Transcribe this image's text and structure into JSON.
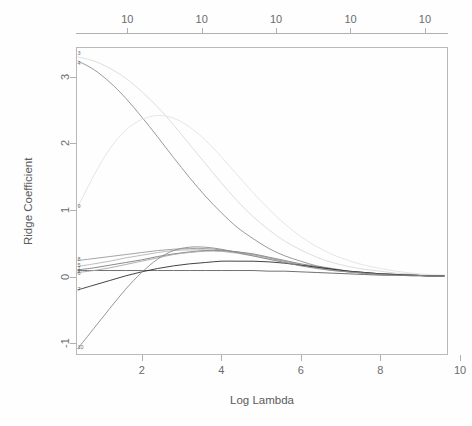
{
  "chart_data": {
    "type": "line",
    "title": "",
    "subtitle": "",
    "xlabel": "Log Lambda",
    "ylabel": "Ridge Coefficient",
    "xlim": [
      0.35,
      9.7
    ],
    "ylim": [
      -1.18,
      3.45
    ],
    "xticks": [
      "2",
      "4",
      "6",
      "8",
      "10"
    ],
    "xtick_values": [
      2,
      4,
      6,
      8,
      10
    ],
    "yticks": [
      "3",
      "2",
      "1",
      "0",
      "-1"
    ],
    "ytick_values": [
      3,
      2,
      1,
      0,
      -1
    ],
    "top_axis_label": "",
    "top_ticks": [
      "10",
      "10",
      "10",
      "10",
      "10"
    ],
    "top_tick_values": [
      10,
      10,
      10,
      10,
      10
    ],
    "grid": false,
    "legend_position": "left-edge-labels",
    "x": [
      0.4,
      0.8,
      1.2,
      1.6,
      2.0,
      2.4,
      2.8,
      3.2,
      3.6,
      4.0,
      4.4,
      4.8,
      5.2,
      5.6,
      6.0,
      6.4,
      6.8,
      7.2,
      7.6,
      8.0,
      8.4,
      8.8,
      9.2,
      9.6
    ],
    "series": [
      {
        "name": "3",
        "label": "3",
        "color": "#d9d9d9",
        "values": [
          3.3,
          3.24,
          3.13,
          2.98,
          2.78,
          2.55,
          2.28,
          1.99,
          1.7,
          1.41,
          1.14,
          0.9,
          0.7,
          0.53,
          0.4,
          0.29,
          0.21,
          0.15,
          0.11,
          0.08,
          0.05,
          0.04,
          0.02,
          0.01
        ]
      },
      {
        "name": "4",
        "label": "4",
        "color": "#8f8f8f",
        "values": [
          3.24,
          3.11,
          2.92,
          2.68,
          2.4,
          2.1,
          1.79,
          1.49,
          1.21,
          0.96,
          0.74,
          0.57,
          0.42,
          0.31,
          0.23,
          0.16,
          0.12,
          0.08,
          0.06,
          0.04,
          0.03,
          0.02,
          0.01,
          0.01
        ]
      },
      {
        "name": "9",
        "label": "9",
        "color": "#e2e2e2",
        "values": [
          1.05,
          1.52,
          1.92,
          2.2,
          2.36,
          2.42,
          2.38,
          2.25,
          2.05,
          1.8,
          1.53,
          1.26,
          1.01,
          0.79,
          0.6,
          0.45,
          0.33,
          0.24,
          0.17,
          0.12,
          0.08,
          0.05,
          0.03,
          0.02
        ]
      },
      {
        "name": "8",
        "label": "8",
        "color": "#9a9a9a",
        "values": [
          0.24,
          0.27,
          0.3,
          0.33,
          0.36,
          0.39,
          0.41,
          0.42,
          0.42,
          0.4,
          0.37,
          0.33,
          0.28,
          0.23,
          0.18,
          0.14,
          0.1,
          0.07,
          0.05,
          0.04,
          0.03,
          0.02,
          0.01,
          0.01
        ]
      },
      {
        "name": "5",
        "label": "5",
        "color": "#b5b5b5",
        "values": [
          0.15,
          0.19,
          0.23,
          0.28,
          0.32,
          0.36,
          0.39,
          0.4,
          0.4,
          0.38,
          0.35,
          0.31,
          0.26,
          0.21,
          0.17,
          0.13,
          0.09,
          0.07,
          0.05,
          0.03,
          0.02,
          0.02,
          0.01,
          0.01
        ]
      },
      {
        "name": "1",
        "label": "1",
        "color": "#7d7d7d",
        "values": [
          0.1,
          0.13,
          0.17,
          0.21,
          0.25,
          0.3,
          0.34,
          0.37,
          0.39,
          0.39,
          0.37,
          0.34,
          0.29,
          0.24,
          0.19,
          0.15,
          0.11,
          0.08,
          0.06,
          0.04,
          0.03,
          0.02,
          0.01,
          0.01
        ]
      },
      {
        "name": "2",
        "label": "2",
        "color": "#606060",
        "values": [
          0.09,
          0.09,
          0.09,
          0.09,
          0.09,
          0.09,
          0.09,
          0.09,
          0.09,
          0.09,
          0.09,
          0.09,
          0.08,
          0.08,
          0.07,
          0.06,
          0.05,
          0.04,
          0.03,
          0.02,
          0.02,
          0.01,
          0.01,
          0.01
        ]
      },
      {
        "name": "6",
        "label": "6",
        "color": "#a8a8a8",
        "values": [
          0.06,
          0.09,
          0.13,
          0.18,
          0.23,
          0.28,
          0.33,
          0.36,
          0.38,
          0.38,
          0.36,
          0.33,
          0.28,
          0.23,
          0.18,
          0.14,
          0.1,
          0.07,
          0.05,
          0.04,
          0.03,
          0.02,
          0.01,
          0.01
        ]
      },
      {
        "name": "7",
        "label": "7",
        "color": "#2e2e2e",
        "values": [
          -0.2,
          -0.13,
          -0.06,
          0.01,
          0.07,
          0.12,
          0.16,
          0.19,
          0.21,
          0.23,
          0.23,
          0.23,
          0.22,
          0.2,
          0.17,
          0.14,
          0.11,
          0.08,
          0.06,
          0.04,
          0.03,
          0.02,
          0.01,
          0.01
        ]
      },
      {
        "name": "10",
        "label": "10",
        "color": "#8a8a8a",
        "values": [
          -1.08,
          -0.78,
          -0.48,
          -0.19,
          0.06,
          0.26,
          0.39,
          0.44,
          0.44,
          0.41,
          0.36,
          0.31,
          0.26,
          0.21,
          0.16,
          0.12,
          0.09,
          0.07,
          0.05,
          0.03,
          0.02,
          0.02,
          0.01,
          0.01
        ]
      }
    ],
    "edge_labels": [
      {
        "label": "3",
        "y": 3.34
      },
      {
        "label": "4",
        "y": 3.2
      },
      {
        "label": "9",
        "y": 1.05
      },
      {
        "label": "8",
        "y": 0.25
      },
      {
        "label": "5",
        "y": 0.16
      },
      {
        "label": "1",
        "y": 0.11
      },
      {
        "label": "2",
        "y": 0.075
      },
      {
        "label": "6",
        "y": 0.04
      },
      {
        "label": "7",
        "y": -0.21
      },
      {
        "label": "10",
        "y": -1.07
      }
    ]
  }
}
